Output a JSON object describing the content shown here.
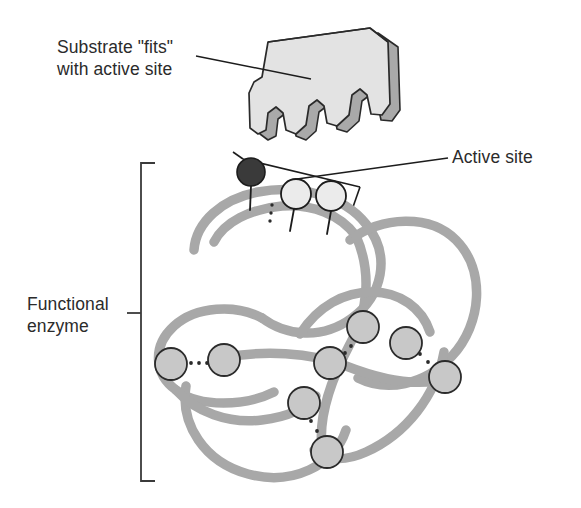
{
  "figure": {
    "width": 581,
    "height": 508,
    "background": "#ffffff"
  },
  "labels": {
    "substrate": "Substrate \"fits\"\nwith active site",
    "active_site": "Active site",
    "functional_enzyme": "Functional\nenzyme"
  },
  "colors": {
    "text": "#2b2b2b",
    "leader_line": "#1c1c1c",
    "bracket": "#3a3a3a",
    "substrate_fill": "#e3e3e3",
    "substrate_edge_fill": "#a9a9a9",
    "substrate_outline": "#2a2a2a",
    "chain": "#a8a8a8",
    "chain_shadow": "#bdbdbd",
    "residue_fill": "#c8c8c8",
    "residue_outline": "#2b2b2b",
    "active_residue_fill": "#ebebeb",
    "r_group_dark_fill": "#3a3a3a",
    "bond_dot": "#2b2b2b"
  },
  "diagram": {
    "substrate": {
      "name": "substrate-block",
      "description": "Three-dimensional block with three rounded tooth-shaped protrusions on its lower edge that match the enzyme active site",
      "teeth_count": 3
    },
    "active_site": {
      "name": "active-site-region",
      "description": "Bracketed region at the top of the folded enzyme containing one dark R group and two pale residues on stalks",
      "residues": [
        {
          "label": "dark-r-group",
          "fill": "#3a3a3a",
          "cx": 251,
          "cy": 172,
          "r": 14
        },
        {
          "label": "pale-residue-1",
          "fill": "#ebebeb",
          "cx": 296,
          "cy": 194,
          "r": 15
        },
        {
          "label": "pale-residue-2",
          "fill": "#ebebeb",
          "cx": 331,
          "cy": 196,
          "r": 15
        }
      ]
    },
    "enzyme": {
      "name": "functional-enzyme",
      "description": "Folded polypeptide chain shown as a thick gray tangled ribbon with interacting residues joined by dotted bonds",
      "residues": [
        {
          "id": "r1",
          "cx": 171,
          "cy": 364,
          "r": 16
        },
        {
          "id": "r2",
          "cx": 224,
          "cy": 360,
          "r": 16
        },
        {
          "id": "r3",
          "cx": 330,
          "cy": 363,
          "r": 16
        },
        {
          "id": "r4",
          "cx": 363,
          "cy": 327,
          "r": 16
        },
        {
          "id": "r5",
          "cx": 406,
          "cy": 343,
          "r": 16
        },
        {
          "id": "r6",
          "cx": 445,
          "cy": 377,
          "r": 16
        },
        {
          "id": "r7",
          "cx": 304,
          "cy": 403,
          "r": 16
        },
        {
          "id": "r8",
          "cx": 327,
          "cy": 452,
          "r": 16
        }
      ],
      "bonds": [
        {
          "from": "r1",
          "to": "r2",
          "style": "dotted"
        },
        {
          "from": "r3",
          "to": "r4",
          "style": "dotted"
        },
        {
          "from": "r5",
          "to": "r6",
          "style": "dotted"
        },
        {
          "from": "r7",
          "to": "r8",
          "style": "dotted"
        }
      ],
      "bracket": {
        "x": 139,
        "top": 163,
        "bottom": 481,
        "tick_y": 313
      }
    }
  }
}
